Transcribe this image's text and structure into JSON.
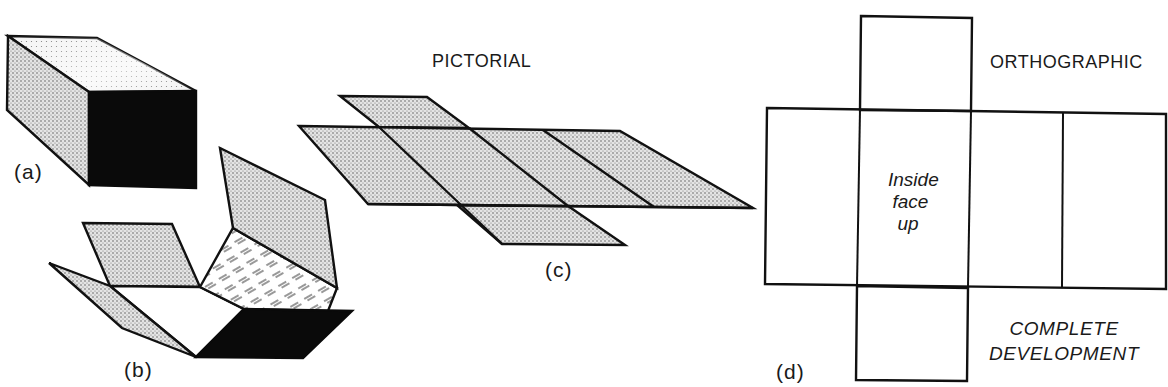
{
  "figure": {
    "title_left": "PICTORIAL",
    "title_right": "ORTHOGRAPHIC",
    "panels": {
      "a": {
        "label": "(a)",
        "description": "Closed rectangular box, shaded pictorial view"
      },
      "b": {
        "label": "(b)",
        "description": "Box partially unfolded, inside hatched"
      },
      "c": {
        "label": "(c)",
        "description": "Flat pictorial development (cross-shaped net)"
      },
      "d": {
        "label": "(d)",
        "description": "Orthographic complete development"
      }
    },
    "orthographic": {
      "center_note_lines": [
        "Inside",
        "face",
        "up"
      ],
      "caption_lines": [
        "COMPLETE",
        "DEVELOPMENT"
      ]
    },
    "colors": {
      "ink": "#111111",
      "stipple": "#bdbdbd",
      "background": "#ffffff",
      "solid_face": "#0a0a0a"
    }
  }
}
